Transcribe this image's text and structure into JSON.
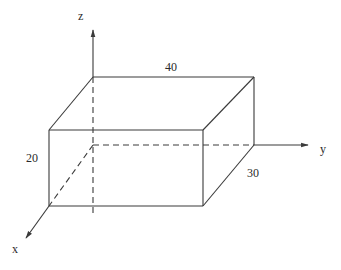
{
  "diagram": {
    "type": "3d-rectangular-box",
    "axes": {
      "x": {
        "label": "x"
      },
      "y": {
        "label": "y"
      },
      "z": {
        "label": "z"
      }
    },
    "dimensions": {
      "length_y": "40",
      "width_x": "30",
      "height_z": "20"
    },
    "colors": {
      "stroke": "#3a3a3a",
      "text": "#2a2a2a",
      "background": "#ffffff"
    }
  }
}
